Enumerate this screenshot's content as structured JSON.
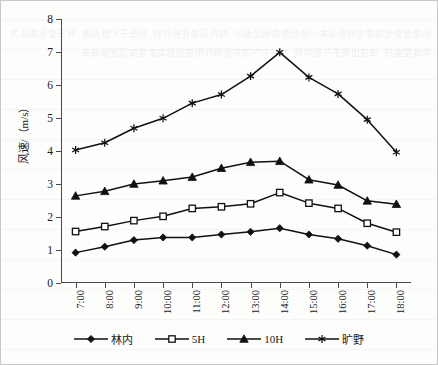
{
  "chart_data": {
    "type": "line",
    "title": "",
    "xlabel": "",
    "ylabel": "风速/（m/s）",
    "ylim": [
      0,
      8
    ],
    "yticks": [
      0,
      1,
      2,
      3,
      4,
      5,
      6,
      7,
      8
    ],
    "grid": false,
    "legend_position": "bottom",
    "categories": [
      "7:00",
      "8:00",
      "9:00",
      "10:00",
      "11:00",
      "12:00",
      "13:00",
      "14:00",
      "15:00",
      "16:00",
      "17:00",
      "18:00"
    ],
    "series": [
      {
        "name": "林内",
        "marker": "filled-diamond",
        "color": "#111111",
        "values": [
          0.92,
          1.1,
          1.3,
          1.38,
          1.38,
          1.47,
          1.55,
          1.66,
          1.47,
          1.34,
          1.13,
          0.86
        ]
      },
      {
        "name": "5H",
        "marker": "open-square",
        "color": "#111111",
        "values": [
          1.56,
          1.71,
          1.89,
          2.02,
          2.26,
          2.31,
          2.4,
          2.74,
          2.42,
          2.26,
          1.81,
          1.54
        ]
      },
      {
        "name": "10H",
        "marker": "filled-triangle",
        "color": "#111111",
        "values": [
          2.64,
          2.78,
          3.0,
          3.1,
          3.21,
          3.48,
          3.66,
          3.69,
          3.13,
          2.97,
          2.49,
          2.39
        ]
      },
      {
        "name": "旷野",
        "marker": "asterisk",
        "color": "#111111",
        "values": [
          4.03,
          4.25,
          4.69,
          4.99,
          5.45,
          5.71,
          6.27,
          6.99,
          6.23,
          5.73,
          4.95,
          3.96
        ]
      }
    ]
  },
  "legend": {
    "items": [
      {
        "label": "林内",
        "marker": "filled-diamond"
      },
      {
        "label": "5H",
        "marker": "open-square"
      },
      {
        "label": "10H",
        "marker": "filled-triangle"
      },
      {
        "label": "旷野",
        "marker": "asterisk"
      }
    ]
  },
  "background": {
    "bleed_text": "的速度变化规律与林外基本一致但数值明显偏小 林内风速在各时刻 均低于旷野风速 其日变化表现为单峰型曲线 峰值出现于午后时段 林分对气流的削弱作用随冠层高度增加而逐渐减弱"
  }
}
